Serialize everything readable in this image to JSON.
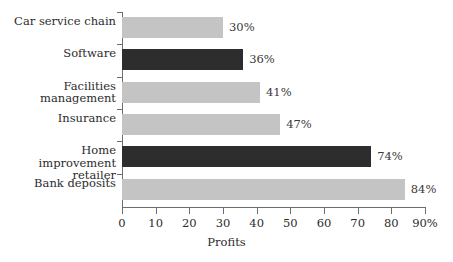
{
  "chart_data": {
    "type": "bar",
    "orientation": "horizontal",
    "title": "",
    "xlabel": "Profits",
    "ylabel": "",
    "xlim": [
      0,
      90
    ],
    "grid": false,
    "legend": "none",
    "categories": [
      "Car service chain",
      "Software",
      "Facilities management",
      "Insurance",
      "Home improvement retailer",
      "Bank deposits"
    ],
    "values": [
      30,
      36,
      41,
      47,
      74,
      84
    ],
    "value_labels": [
      "30%",
      "36%",
      "41%",
      "47%",
      "74%",
      "84%"
    ],
    "bar_colors": [
      "#c4c4c4",
      "#2d2d2d",
      "#c4c4c4",
      "#c4c4c4",
      "#2d2d2d",
      "#c4c4c4"
    ],
    "xticks": [
      0,
      10,
      20,
      30,
      40,
      50,
      60,
      70,
      80,
      90
    ],
    "xtick_labels": [
      "0",
      "10",
      "20",
      "30",
      "40",
      "50",
      "60",
      "70",
      "80",
      "90%"
    ]
  },
  "colors": {
    "light_bar": "#c4c4c4",
    "dark_bar": "#2d2d2d",
    "axis": "#6e6e6e",
    "text": "#2b2b2b",
    "background": "#ffffff"
  }
}
